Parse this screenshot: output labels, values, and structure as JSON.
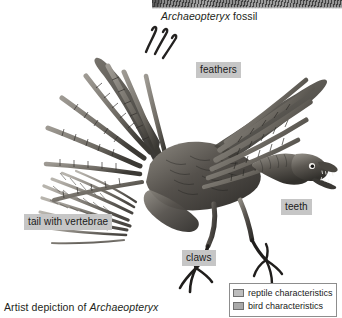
{
  "figure": {
    "title_top": "Archaeopteryx fossil",
    "title_bottom_prefix": "Artist depiction of ",
    "title_bottom_species": "Archaeopteryx",
    "fossil_caption_species": "Archaeopteryx",
    "fossil_caption_suffix": " fossil"
  },
  "callouts": [
    {
      "id": "feathers",
      "label": "feathers"
    },
    {
      "id": "teeth",
      "label": "teeth"
    },
    {
      "id": "tail",
      "label": "tail with vertebrae"
    },
    {
      "id": "claws",
      "label": "claws"
    }
  ],
  "legend": {
    "items": [
      {
        "label": "reptile characteristics",
        "swatch_color": "#bdbdbd"
      },
      {
        "label": "bird characteristics",
        "swatch_color": "#a9a9a9"
      }
    ]
  },
  "colors": {
    "label_background": "#c6c6c6",
    "text": "#231f20",
    "legend_border": "#8d8d8d",
    "page_background": "#ffffff",
    "artwork_dark": "#3a3835",
    "artwork_mid": "#7e7a74",
    "artwork_light": "#c9c5be"
  },
  "icons": {
    "reptile_swatch": "square-swatch-icon",
    "bird_swatch": "square-swatch-icon"
  }
}
